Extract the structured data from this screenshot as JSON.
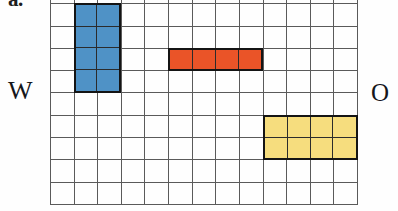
{
  "figure_label": "a.",
  "compass": {
    "west_label": "W",
    "east_label": "O"
  },
  "grid": {
    "columns": 13,
    "rows": 10,
    "visible_rows": 9,
    "line_color": "#5a5a5a",
    "background": "#ffffff"
  },
  "shapes": [
    {
      "id": "blue-rectangle",
      "name": "blue-rectangle",
      "color": "#4f92c6",
      "outline": "#141414",
      "col_start": 2,
      "row_start": 2,
      "cols": 2,
      "rows": 4,
      "area_cells": 8,
      "perimeter_cells": 12
    },
    {
      "id": "orange-rectangle",
      "name": "orange-rectangle",
      "color": "#ea5428",
      "outline": "#141414",
      "col_start": 6,
      "row_start": 4,
      "cols": 4,
      "rows": 1,
      "area_cells": 4,
      "perimeter_cells": 10
    },
    {
      "id": "yellow-rectangle",
      "name": "yellow-rectangle",
      "color": "#f6dd7e",
      "outline": "#141414",
      "col_start": 10,
      "row_start": 7,
      "cols": 4,
      "rows": 2,
      "area_cells": 8,
      "perimeter_cells": 12
    }
  ]
}
